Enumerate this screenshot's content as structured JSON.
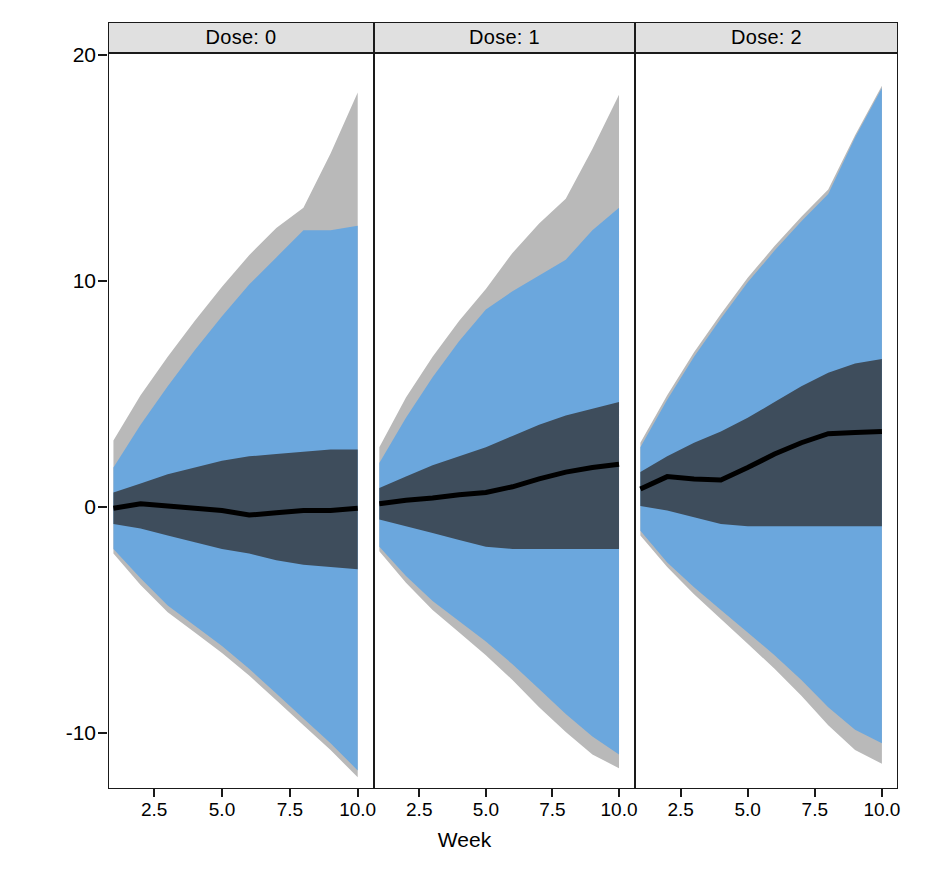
{
  "chart_data": {
    "type": "area",
    "title": "",
    "xlabel": "Week",
    "ylabel": "Response",
    "xlim": [
      0.8,
      10.6
    ],
    "ylim": [
      -12.5,
      20.8
    ],
    "xticks": [
      2.5,
      5.0,
      7.5,
      10.0
    ],
    "xticklabels": [
      "2.5",
      "5.0",
      "7.5",
      "10.0"
    ],
    "yticks": [
      20,
      10,
      0,
      -10
    ],
    "yticklabels": [
      "20",
      "10",
      "0",
      "-10"
    ],
    "grid": false,
    "legend": "none",
    "facet_variable": "Dose",
    "facet_labels": [
      "Dose: 0",
      "Dose: 1",
      "Dose: 2"
    ],
    "x": [
      1,
      2,
      3,
      4,
      5,
      6,
      7,
      8,
      9,
      10
    ],
    "panels": [
      {
        "label": "Dose: 0",
        "median": [
          -0.1,
          0.1,
          0.0,
          -0.1,
          -0.2,
          -0.4,
          -0.3,
          -0.2,
          -0.2,
          -0.1
        ],
        "inner_lower": [
          -0.8,
          -1.0,
          -1.3,
          -1.6,
          -1.9,
          -2.1,
          -2.4,
          -2.6,
          -2.7,
          -2.8
        ],
        "inner_upper": [
          0.6,
          1.0,
          1.4,
          1.7,
          2.0,
          2.2,
          2.3,
          2.4,
          2.5,
          2.5
        ],
        "outer_lower": [
          -1.9,
          -3.2,
          -4.4,
          -5.3,
          -6.2,
          -7.2,
          -8.3,
          -9.4,
          -10.5,
          -11.7
        ],
        "outer_upper": [
          1.7,
          3.6,
          5.3,
          6.9,
          8.4,
          9.8,
          11.0,
          12.2,
          12.2,
          12.4
        ],
        "extreme_lower": [
          -2.1,
          -3.5,
          -4.7,
          -5.6,
          -6.5,
          -7.5,
          -8.6,
          -9.7,
          -10.8,
          -12.0
        ],
        "extreme_upper": [
          2.9,
          4.9,
          6.6,
          8.2,
          9.7,
          11.1,
          12.3,
          13.2,
          15.6,
          18.3
        ]
      },
      {
        "label": "Dose: 1",
        "median": [
          0.1,
          0.25,
          0.35,
          0.5,
          0.6,
          0.85,
          1.2,
          1.5,
          1.7,
          1.85
        ],
        "inner_lower": [
          -0.6,
          -0.9,
          -1.2,
          -1.5,
          -1.8,
          -1.9,
          -1.9,
          -1.9,
          -1.9,
          -1.9
        ],
        "inner_upper": [
          0.8,
          1.3,
          1.8,
          2.2,
          2.6,
          3.1,
          3.6,
          4.0,
          4.3,
          4.6
        ],
        "outer_lower": [
          -1.8,
          -3.1,
          -4.2,
          -5.1,
          -6.0,
          -7.0,
          -8.1,
          -9.2,
          -10.2,
          -11.0
        ],
        "outer_upper": [
          1.9,
          3.9,
          5.7,
          7.3,
          8.7,
          9.5,
          10.2,
          10.9,
          12.2,
          13.2
        ],
        "extreme_lower": [
          -2.0,
          -3.4,
          -4.6,
          -5.6,
          -6.6,
          -7.7,
          -8.9,
          -10.0,
          -11.0,
          -11.6
        ],
        "extreme_upper": [
          2.6,
          4.8,
          6.6,
          8.2,
          9.6,
          11.2,
          12.5,
          13.6,
          15.8,
          18.2
        ]
      },
      {
        "label": "Dose: 2",
        "median": [
          0.75,
          1.3,
          1.2,
          1.15,
          1.7,
          2.3,
          2.8,
          3.2,
          3.25,
          3.3
        ],
        "inner_lower": [
          0.0,
          -0.2,
          -0.5,
          -0.8,
          -0.9,
          -0.9,
          -0.9,
          -0.9,
          -0.9,
          -0.9
        ],
        "inner_upper": [
          1.5,
          2.2,
          2.8,
          3.3,
          3.9,
          4.6,
          5.3,
          5.9,
          6.3,
          6.5
        ],
        "outer_lower": [
          -1.1,
          -2.5,
          -3.6,
          -4.6,
          -5.6,
          -6.6,
          -7.7,
          -8.9,
          -9.9,
          -10.5
        ],
        "outer_upper": [
          2.6,
          4.7,
          6.6,
          8.3,
          9.9,
          11.3,
          12.6,
          13.8,
          16.3,
          18.5
        ],
        "extreme_lower": [
          -1.3,
          -2.7,
          -3.9,
          -5.0,
          -6.1,
          -7.2,
          -8.4,
          -9.7,
          -10.8,
          -11.4
        ],
        "extreme_upper": [
          2.8,
          4.9,
          6.8,
          8.5,
          10.1,
          11.5,
          12.8,
          14.0,
          16.4,
          18.6
        ]
      }
    ],
    "colors": {
      "extreme_band": "#b9b9b9",
      "outer_band": "#6ba7dd",
      "inner_band": "#3e4d5c",
      "median_line": "#000000",
      "strip_background": "#e0e0e0",
      "axis": "#1a1a1a"
    }
  },
  "caption": ""
}
